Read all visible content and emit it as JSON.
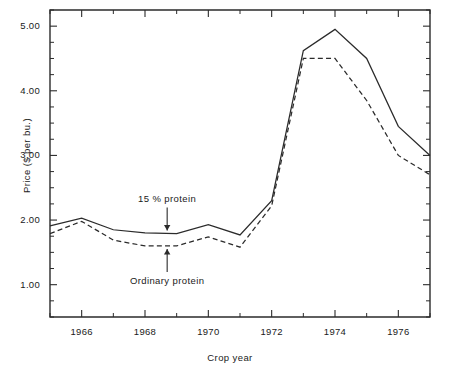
{
  "chart_data": {
    "type": "line",
    "title": "",
    "xlabel": "Crop year",
    "ylabel": "Price ($ per bu.)",
    "xlim": [
      1965,
      1977
    ],
    "ylim": [
      0.5,
      5.25
    ],
    "xticks": [
      1966,
      1968,
      1970,
      1972,
      1974,
      1976
    ],
    "xtick_labels": [
      "1966",
      "1968",
      "1970",
      "1972",
      "1974",
      "1976"
    ],
    "yticks": [
      1.0,
      2.0,
      3.0,
      4.0,
      5.0
    ],
    "ytick_labels": [
      "1.00",
      "2.00",
      "3.00",
      "4.00",
      "5.00"
    ],
    "ytick_minor_step": 0.25,
    "grid": false,
    "legend": "annotated-inline",
    "x": [
      1965,
      1966,
      1967,
      1968,
      1969,
      1970,
      1971,
      1972,
      1973,
      1974,
      1975,
      1976,
      1977
    ],
    "series": [
      {
        "name": "15 % protein",
        "style": "solid",
        "color": "#2b2b2b",
        "values": [
          1.91,
          2.03,
          1.85,
          1.8,
          1.79,
          1.93,
          1.77,
          2.3,
          4.62,
          4.95,
          4.5,
          3.45,
          3.0
        ]
      },
      {
        "name": "Ordinary protein",
        "style": "dashed",
        "color": "#2b2b2b",
        "values": [
          1.79,
          1.98,
          1.69,
          1.6,
          1.6,
          1.74,
          1.58,
          2.22,
          4.5,
          4.5,
          3.85,
          3.0,
          2.7
        ]
      }
    ],
    "annotations": [
      {
        "name": "15 % protein",
        "text": "15 % protein",
        "arrow_direction": "down",
        "points_to_series": "15 % protein",
        "at_x": 1968.7
      },
      {
        "name": "Ordinary protein",
        "text": "Ordinary protein",
        "arrow_direction": "up",
        "points_to_series": "Ordinary protein",
        "at_x": 1968.7
      }
    ]
  }
}
